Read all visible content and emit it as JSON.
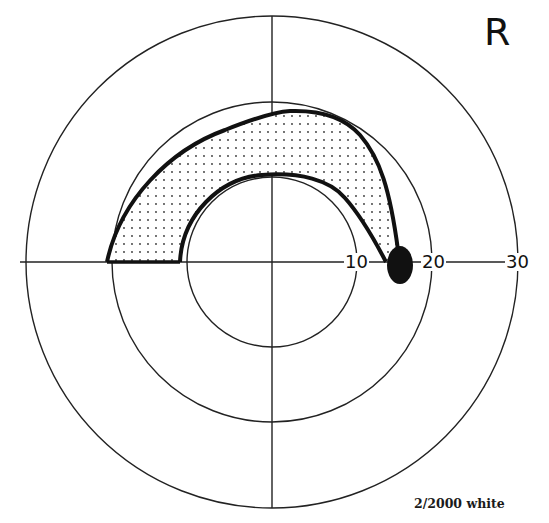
{
  "figure": {
    "type": "visual-field-perimetry-chart",
    "eye_label": "R",
    "stimulus_label": "2/2000 white",
    "center": {
      "x": 272,
      "y": 262
    },
    "rings": [
      {
        "degrees": 10,
        "radius_px": 85
      },
      {
        "degrees": 20,
        "radius_px": 160
      },
      {
        "degrees": 30,
        "radius_px": 246
      }
    ],
    "tick_labels": [
      {
        "text": "10",
        "x": 345,
        "y": 253
      },
      {
        "text": "20",
        "x": 424,
        "y": 253
      },
      {
        "text": "30",
        "x": 507,
        "y": 253
      }
    ],
    "scotoma": {
      "description": "Arcuate (Bjerrum) scotoma, stippled, upper field, connected to blind spot",
      "fill": "stippled",
      "outer_edge_path": "M107,262 C120,200 170,150 225,130 C255,118 275,112 290,111 C320,110 345,118 360,135 C380,158 390,190 398,250",
      "inner_edge_path": "M180,262 C182,215 220,178 262,175 C300,172 330,180 345,198 C360,215 372,235 386,262"
    },
    "blind_spot": {
      "cx": 400,
      "cy": 265,
      "rx": 13,
      "ry": 19,
      "color": "#111111"
    }
  }
}
